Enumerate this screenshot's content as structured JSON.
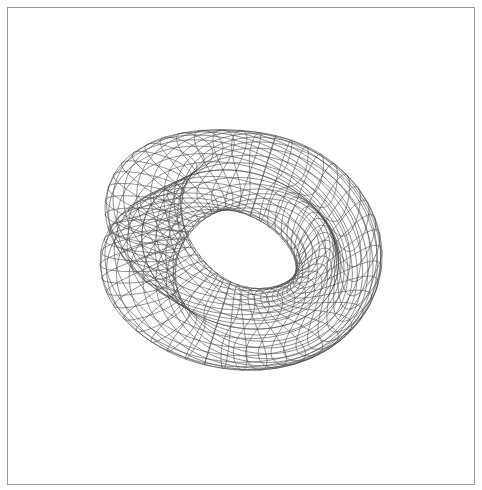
{
  "figure": {
    "kind": "wireframe-mesh-plot",
    "title": "",
    "caption": "",
    "background_color": "#ffffff",
    "line_color": "#4a4a4a",
    "frame_color": "#9a9a9a",
    "frame": {
      "visible": true,
      "x": 7,
      "y": 7,
      "width": 468,
      "height": 478,
      "stroke_width": 1
    },
    "canvas": {
      "width": 482,
      "height": 490
    }
  },
  "chart_data": {
    "type": "line",
    "title": "",
    "subtitle": "",
    "xlabel": "",
    "ylabel": "",
    "legend": [],
    "grid": false,
    "axes_visible": false,
    "tick_labels_x": [],
    "tick_labels_y": [],
    "surface": {
      "name": "Klein bottle (figure-8 immersion)",
      "render_style": "wireframe",
      "equations": {
        "x": "(a + cos(v/2)*sin(u) - sin(v/2)*sin(2u)) * cos(v)",
        "y": "(a + cos(v/2)*sin(u) - sin(v/2)*sin(2u)) * sin(v)",
        "z": "sin(v/2)*sin(u) + cos(v/2)*sin(2u)"
      },
      "parameters": {
        "a": 2.6
      },
      "u_range": [
        0,
        6.283185307179586
      ],
      "v_range": [
        0,
        6.283185307179586
      ],
      "u_steps": 34,
      "v_steps": 46
    },
    "view": {
      "azimuth_deg": 28,
      "elevation_deg": 64,
      "roll_deg": 18,
      "projection": "orthographic",
      "scale": 66,
      "center_x": 238,
      "center_y": 250
    },
    "x": [],
    "values": []
  }
}
